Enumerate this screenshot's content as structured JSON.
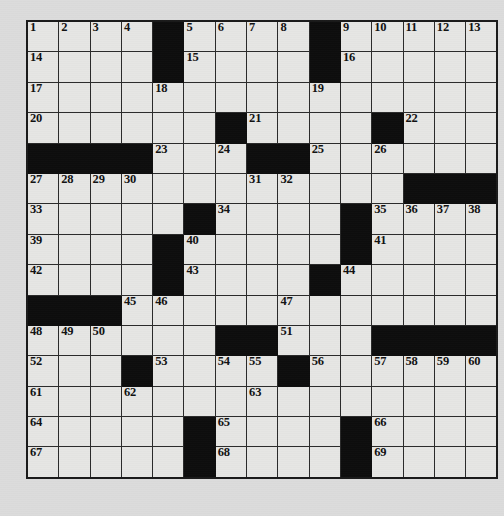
{
  "puzzle": {
    "type": "crossword-grid",
    "rows": 15,
    "cols": 15,
    "colors": {
      "page_background": "#dcdcdc",
      "cell_fill": "#e6e6e4",
      "block_fill": "#0d0d0d",
      "grid_line": "#2a2a2a",
      "outer_border": "#1a1a1a",
      "number_color": "#111111"
    },
    "grid": [
      [
        "1",
        "2",
        "3",
        "4",
        "#",
        "5",
        "6",
        "7",
        "8",
        "#",
        "9",
        "10",
        "11",
        "12",
        "13"
      ],
      [
        "14",
        "",
        "",
        "",
        "#",
        "15",
        "",
        "",
        "",
        "#",
        "16",
        "",
        "",
        "",
        ""
      ],
      [
        "17",
        "",
        "",
        "",
        "18",
        "",
        "",
        "",
        "",
        "19",
        "",
        "",
        "",
        "",
        ""
      ],
      [
        "20",
        "",
        "",
        "",
        "",
        "",
        "#",
        "21",
        "",
        "",
        "",
        "#",
        "22",
        "",
        ""
      ],
      [
        "#",
        "#",
        "#",
        "#",
        "23",
        "",
        "24",
        "#",
        "#",
        "25",
        "",
        "26",
        "",
        "",
        ""
      ],
      [
        "27",
        "28",
        "29",
        "30",
        "",
        "",
        "",
        "31",
        "32",
        "",
        "",
        "",
        "#",
        "#",
        "#"
      ],
      [
        "33",
        "",
        "",
        "",
        "",
        "#",
        "34",
        "",
        "",
        "",
        "#",
        "35",
        "36",
        "37",
        "38"
      ],
      [
        "39",
        "",
        "",
        "",
        "#",
        "40",
        "",
        "",
        "",
        "",
        "#",
        "41",
        "",
        "",
        ""
      ],
      [
        "42",
        "",
        "",
        "",
        "#",
        "43",
        "",
        "",
        "",
        "#",
        "44",
        "",
        "",
        "",
        ""
      ],
      [
        "#",
        "#",
        "#",
        "45",
        "46",
        "",
        "",
        "",
        "47",
        "",
        "",
        "",
        "",
        "",
        ""
      ],
      [
        "48",
        "49",
        "50",
        "",
        "",
        "",
        "#",
        "#",
        "51",
        "",
        "",
        "#",
        "#",
        "#",
        "#"
      ],
      [
        "52",
        "",
        "",
        "#",
        "53",
        "",
        "54",
        "55",
        "#",
        "56",
        "",
        "57",
        "58",
        "59",
        "60"
      ],
      [
        "61",
        "",
        "",
        "62",
        "",
        "",
        "",
        "63",
        "",
        "",
        "",
        "",
        "",
        "",
        ""
      ],
      [
        "64",
        "",
        "",
        "",
        "",
        "#",
        "65",
        "",
        "",
        "",
        "#",
        "66",
        "",
        "",
        ""
      ],
      [
        "67",
        "",
        "",
        "",
        "",
        "#",
        "68",
        "",
        "",
        "",
        "#",
        "69",
        "",
        "",
        ""
      ]
    ],
    "clue_numbers": [
      1,
      2,
      3,
      4,
      5,
      6,
      7,
      8,
      9,
      10,
      11,
      12,
      13,
      14,
      15,
      16,
      17,
      18,
      19,
      20,
      21,
      22,
      23,
      24,
      25,
      26,
      27,
      28,
      29,
      30,
      31,
      32,
      33,
      34,
      35,
      36,
      37,
      38,
      39,
      40,
      41,
      42,
      43,
      44,
      45,
      46,
      47,
      48,
      49,
      50,
      51,
      52,
      53,
      54,
      55,
      56,
      57,
      58,
      59,
      60,
      61,
      62,
      63,
      64,
      65,
      66,
      67,
      68,
      69
    ],
    "total_numbered_cells": 69,
    "block_count": 36
  }
}
